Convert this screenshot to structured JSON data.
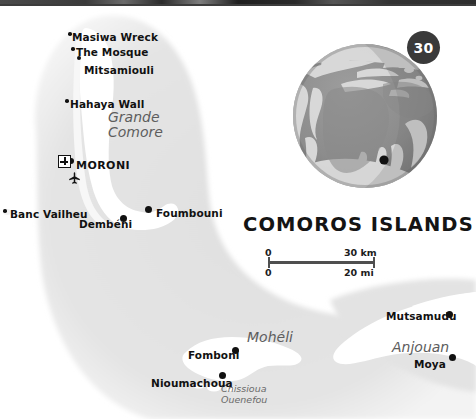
{
  "map": {
    "title": "COMOROS ISLANDS",
    "page_badge": "30",
    "colors": {
      "land": "#ffffff",
      "shelf": "#e2e2e2",
      "sea": "#ffffff",
      "label": "#111111",
      "island_label": "#5d5d5d",
      "badge_bg": "#3a3a3a",
      "scale_bar": "#4f4f4f"
    },
    "scale": {
      "km_start": "0",
      "km_end": "30 km",
      "mi_start": "0",
      "mi_end": "20 mi"
    },
    "island_labels": [
      {
        "name": "Grande Comore",
        "line1": "Grande",
        "line2": "Comore",
        "x": 108,
        "y": 110
      },
      {
        "name": "Mohéli",
        "line1": "Mohéli",
        "line2": "",
        "x": 247,
        "y": 330
      },
      {
        "name": "Anjouan",
        "line1": "Anjouan",
        "line2": "",
        "x": 392,
        "y": 340
      },
      {
        "name": "Chissioua Ouenefou",
        "line1": "Chissioua",
        "line2": "Ouenefou",
        "x": 221,
        "y": 384
      }
    ],
    "places": [
      {
        "label": "Masiwa Wreck",
        "x": 72,
        "y": 32,
        "dot_x": 70,
        "dot_y": 34,
        "dot": "xs",
        "side": "right"
      },
      {
        "label": "The Mosque",
        "x": 76,
        "y": 47,
        "dot_x": 73,
        "dot_y": 49,
        "dot": "xs",
        "side": "right"
      },
      {
        "label": "Mitsamiouli",
        "x": 84,
        "y": 65,
        "dot_x": 79,
        "dot_y": 58,
        "dot": "sm",
        "side": "right"
      },
      {
        "label": "Hahaya Wall",
        "x": 70,
        "y": 99,
        "dot_x": 67,
        "dot_y": 101,
        "dot": "xs",
        "side": "right"
      },
      {
        "label": "MORONI",
        "x": 76,
        "y": 160,
        "dot_x": 71,
        "dot_y": 161,
        "dot": "mid",
        "side": "right"
      },
      {
        "label": "Banc Vailheu",
        "x": 10,
        "y": 209,
        "dot_x": 5,
        "dot_y": 211,
        "dot": "xs",
        "side": "right"
      },
      {
        "label": "Dembéni",
        "x": 79,
        "y": 219,
        "dot_x": 123,
        "dot_y": 218,
        "dot": "big",
        "side": "left"
      },
      {
        "label": "Foumbouni",
        "x": 156,
        "y": 208,
        "dot_x": 148,
        "dot_y": 209,
        "dot": "big",
        "side": "right"
      },
      {
        "label": "Fomboni",
        "x": 188,
        "y": 350,
        "dot_x": 235,
        "dot_y": 350,
        "dot": "big",
        "side": "left"
      },
      {
        "label": "Nioumachoua",
        "x": 151,
        "y": 378,
        "dot_x": 222,
        "dot_y": 375,
        "dot": "big",
        "side": "left"
      },
      {
        "label": "Mutsamudu",
        "x": 386,
        "y": 311,
        "dot_x": 449,
        "dot_y": 314,
        "dot": "big",
        "side": "left"
      },
      {
        "label": "Moya",
        "x": 414,
        "y": 359,
        "dot_x": 452,
        "dot_y": 357,
        "dot": "big",
        "side": "left"
      }
    ],
    "symbols": [
      {
        "name": "hospital-symbol",
        "x": 58,
        "y": 155
      },
      {
        "name": "airport-symbol",
        "x": 68,
        "y": 170
      }
    ]
  }
}
